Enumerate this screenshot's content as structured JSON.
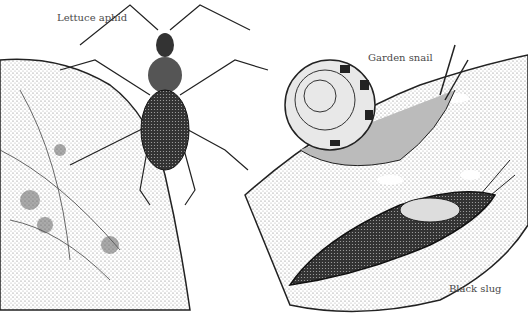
{
  "illustration": {
    "labels": {
      "aphid": "Lettuce aphid",
      "snail": "Garden snail",
      "slug": "Black slug"
    },
    "colors": {
      "ink": "#1a1a1a",
      "leaf_stipple": "#d9d9d9",
      "background": "#ffffff",
      "label_text": "#4a4a4a"
    }
  }
}
